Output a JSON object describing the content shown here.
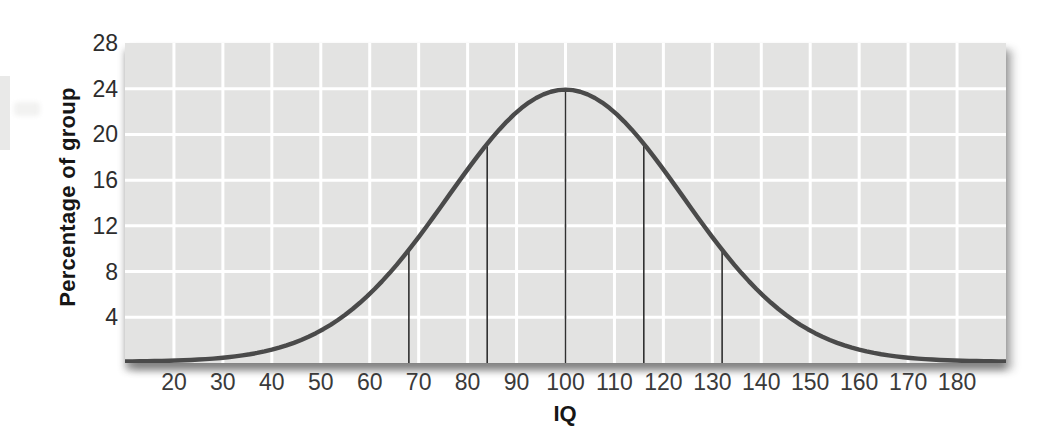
{
  "chart_data": {
    "type": "line",
    "subtype": "normal-distribution-curve",
    "title": "",
    "xlabel": "IQ",
    "ylabel": "Percentage of group",
    "x_ticks": [
      20,
      30,
      40,
      50,
      60,
      70,
      80,
      90,
      100,
      110,
      120,
      130,
      140,
      150,
      160,
      170,
      180
    ],
    "y_ticks": [
      4,
      8,
      12,
      16,
      20,
      24,
      28
    ],
    "xlim": [
      10,
      190
    ],
    "ylim": [
      0,
      28
    ],
    "grid": true,
    "legend": "none",
    "curve": {
      "shape": "gaussian",
      "mean": 100,
      "sigma": 24,
      "peak": 23.8
    },
    "sd_marker_lines_x": [
      68,
      84,
      100,
      116,
      132
    ],
    "points": [
      {
        "x": 20,
        "y": 0.1
      },
      {
        "x": 30,
        "y": 0.3
      },
      {
        "x": 40,
        "y": 1.0
      },
      {
        "x": 50,
        "y": 2.7
      },
      {
        "x": 60,
        "y": 5.9
      },
      {
        "x": 70,
        "y": 11.0
      },
      {
        "x": 80,
        "y": 16.8
      },
      {
        "x": 90,
        "y": 21.8
      },
      {
        "x": 100,
        "y": 23.8
      },
      {
        "x": 110,
        "y": 21.8
      },
      {
        "x": 120,
        "y": 16.8
      },
      {
        "x": 130,
        "y": 11.0
      },
      {
        "x": 140,
        "y": 5.9
      },
      {
        "x": 150,
        "y": 2.7
      },
      {
        "x": 160,
        "y": 1.0
      },
      {
        "x": 170,
        "y": 0.3
      },
      {
        "x": 180,
        "y": 0.1
      }
    ],
    "colors": {
      "plot_background": "#e3e3e2",
      "gridline": "#ffffff",
      "curve": "#4a4a4a",
      "marker_line": "#303030",
      "tick_text": "#3a3a3a",
      "axis_title": "#161616",
      "shadow": "rgba(40,40,40,0.42)"
    }
  }
}
